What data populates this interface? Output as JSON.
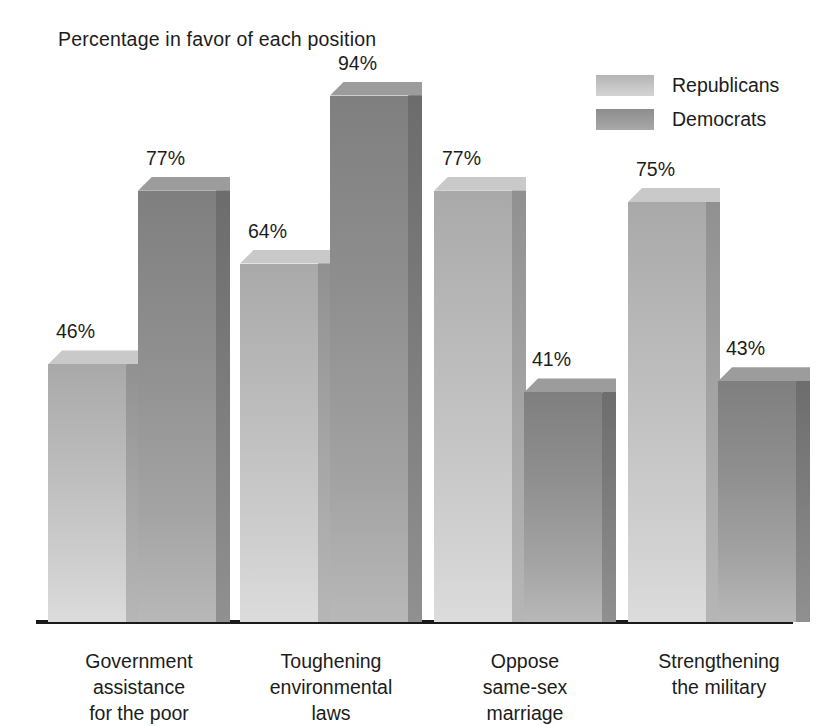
{
  "chart_data": {
    "type": "bar",
    "title": "Percentage in favor of each position",
    "xlabel": "",
    "ylabel": "",
    "ylim": [
      0,
      100
    ],
    "grid": false,
    "legend_position": "top-right",
    "value_suffix": "%",
    "categories": [
      "Government assistance for the poor",
      "Toughening environmental laws",
      "Oppose same-sex marriage",
      "Strengthening the military"
    ],
    "category_lines": [
      [
        "Government",
        "assistance",
        "for the poor"
      ],
      [
        "Toughening",
        "environmental",
        "laws"
      ],
      [
        "Oppose",
        "same-sex",
        "marriage"
      ],
      [
        "Strengthening",
        "the military"
      ]
    ],
    "series": [
      {
        "name": "Republicans",
        "color": "#c2c2c2",
        "values": [
          46,
          64,
          77,
          75
        ]
      },
      {
        "name": "Democrats",
        "color": "#909090",
        "values": [
          77,
          94,
          41,
          43
        ]
      }
    ],
    "value_labels": [
      "46%",
      "77%",
      "64%",
      "94%",
      "77%",
      "41%",
      "75%",
      "43%"
    ]
  },
  "legend": {
    "items": [
      {
        "label": "Republicans",
        "swatch": "rep"
      },
      {
        "label": "Democrats",
        "swatch": "dem"
      }
    ]
  },
  "axis": {
    "baseline_color": "#1a1a1a"
  }
}
